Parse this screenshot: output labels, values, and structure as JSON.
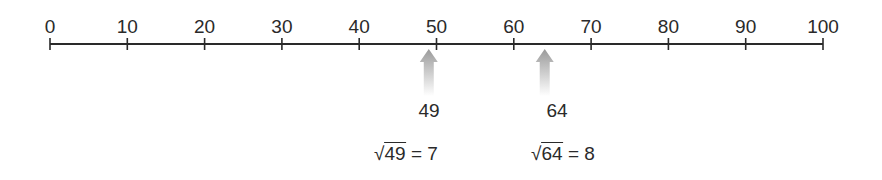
{
  "number_line": {
    "min": 0,
    "max": 100,
    "step": 10,
    "ticks": [
      "0",
      "10",
      "20",
      "30",
      "40",
      "50",
      "60",
      "70",
      "80",
      "90",
      "100"
    ],
    "line_color": "#2a2a2a"
  },
  "markers": [
    {
      "value": 49,
      "label": "49",
      "radicand": "49",
      "equation_rest": " = 7",
      "arrow_color": "#9a9a9a"
    },
    {
      "value": 64,
      "label": "64",
      "radicand": "64",
      "equation_rest": " = 8",
      "arrow_color": "#9a9a9a"
    }
  ],
  "sqrt_symbol": "√"
}
